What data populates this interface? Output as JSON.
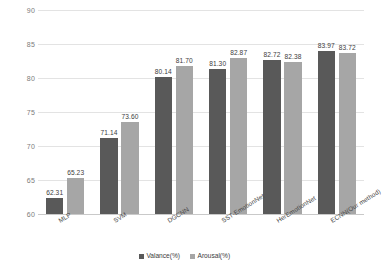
{
  "chart_data": {
    "type": "bar",
    "title": "",
    "subtitle": "",
    "xlabel": "",
    "ylabel": "",
    "categories": [
      "MLP",
      "SVM",
      "DGCNN",
      "SST-EmotionNet",
      "HerEmotionNet",
      "ECNN(Our method)"
    ],
    "series": [
      {
        "name": "Valance(%)",
        "color": "#595959",
        "values": [
          62.31,
          71.14,
          80.14,
          81.3,
          82.72,
          83.97
        ],
        "labels": [
          "62.31",
          "71.14",
          "80.14",
          "81.30",
          "82.72",
          "83.97"
        ]
      },
      {
        "name": "Arousal(%)",
        "color": "#a6a6a6",
        "values": [
          65.23,
          73.6,
          81.7,
          82.87,
          82.38,
          83.72
        ],
        "labels": [
          "65.23",
          "73.60",
          "81.70",
          "82.87",
          "82.38",
          "83.72"
        ]
      }
    ],
    "ylim": [
      60,
      90
    ],
    "ytick_values": [
      60,
      65,
      70,
      75,
      80,
      85,
      90
    ],
    "ytick_labels": [
      "60",
      "65",
      "70",
      "75",
      "80",
      "85",
      "90"
    ],
    "grid": true,
    "legend_position": "bottom",
    "legend_entries": [
      "Valance(%)",
      "Arousal(%)"
    ]
  }
}
